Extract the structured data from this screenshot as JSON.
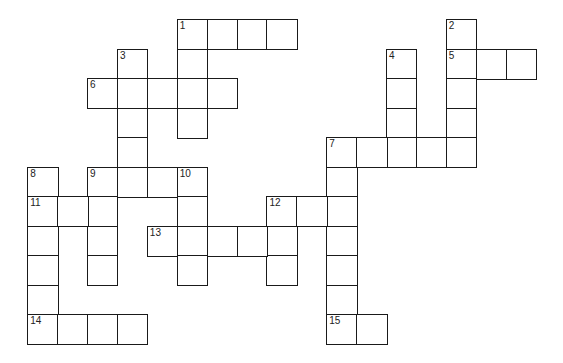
{
  "puzzle": {
    "type": "crossword",
    "grid": {
      "origin_x": 28,
      "origin_y": 20,
      "cell_w": 29.9,
      "cell_h": 29.5,
      "line_color": "#1a1a1a",
      "background": "#ffffff"
    },
    "entries": [
      {
        "number": "1",
        "direction": "across",
        "row": 0,
        "col": 5,
        "length": 4
      },
      {
        "number": "1",
        "direction": "down",
        "row": 0,
        "col": 5,
        "length": 4
      },
      {
        "number": "2",
        "direction": "down",
        "row": 0,
        "col": 14,
        "length": 5
      },
      {
        "number": "3",
        "direction": "down",
        "row": 1,
        "col": 3,
        "length": 5
      },
      {
        "number": "4",
        "direction": "down",
        "row": 1,
        "col": 12,
        "length": 4
      },
      {
        "number": "5",
        "direction": "across",
        "row": 1,
        "col": 14,
        "length": 3
      },
      {
        "number": "6",
        "direction": "across",
        "row": 2,
        "col": 2,
        "length": 5
      },
      {
        "number": "7",
        "direction": "across",
        "row": 4,
        "col": 10,
        "length": 5
      },
      {
        "number": "7",
        "direction": "down",
        "row": 4,
        "col": 10,
        "length": 7
      },
      {
        "number": "8",
        "direction": "down",
        "row": 5,
        "col": 0,
        "length": 6
      },
      {
        "number": "9",
        "direction": "across",
        "row": 5,
        "col": 2,
        "length": 4
      },
      {
        "number": "9",
        "direction": "down",
        "row": 5,
        "col": 2,
        "length": 4
      },
      {
        "number": "10",
        "direction": "down",
        "row": 5,
        "col": 5,
        "length": 4
      },
      {
        "number": "11",
        "direction": "across",
        "row": 6,
        "col": 0,
        "length": 3
      },
      {
        "number": "12",
        "direction": "across",
        "row": 6,
        "col": 8,
        "length": 3
      },
      {
        "number": "12",
        "direction": "down",
        "row": 6,
        "col": 8,
        "length": 3
      },
      {
        "number": "13",
        "direction": "across",
        "row": 7,
        "col": 4,
        "length": 5
      },
      {
        "number": "14",
        "direction": "across",
        "row": 10,
        "col": 0,
        "length": 4
      },
      {
        "number": "15",
        "direction": "across",
        "row": 10,
        "col": 10,
        "length": 2
      }
    ]
  }
}
